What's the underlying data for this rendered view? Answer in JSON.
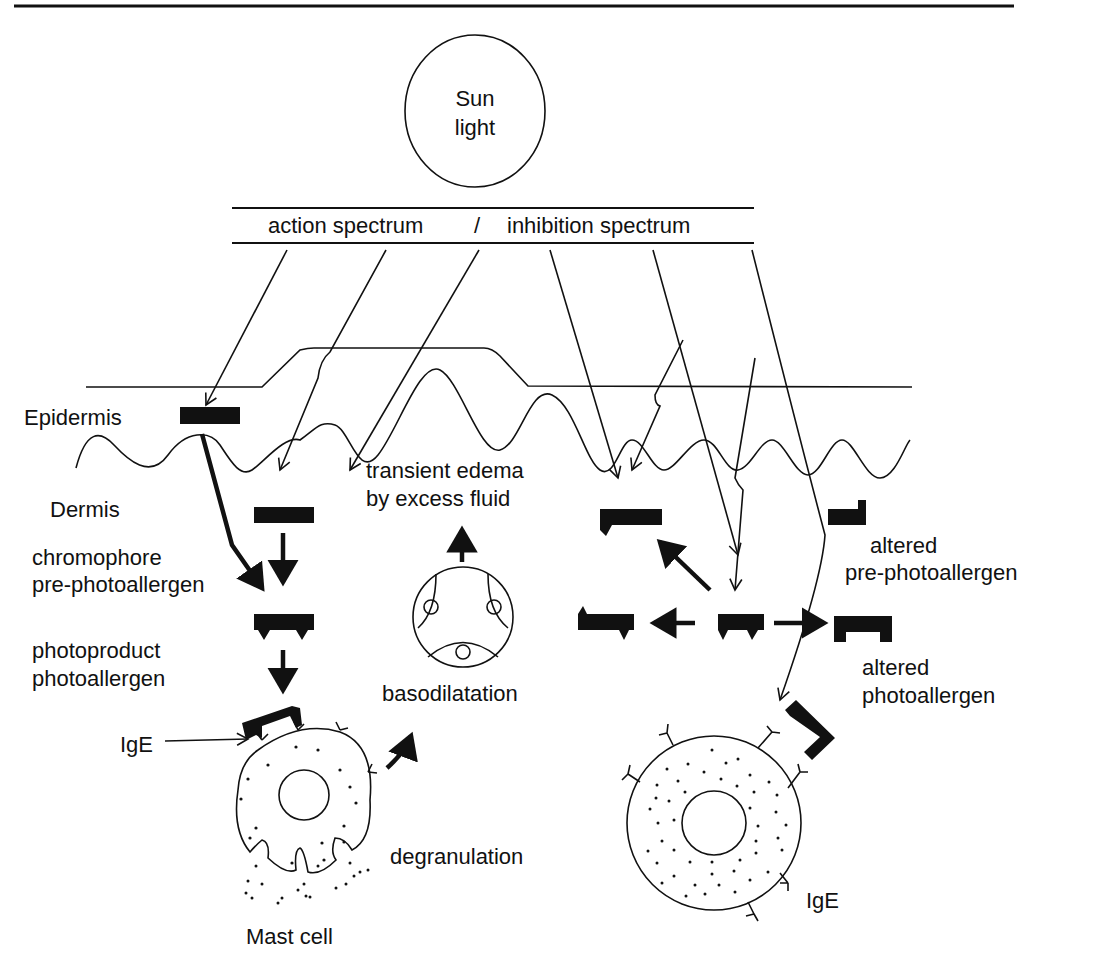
{
  "figure": {
    "sun": {
      "line1": "Sun",
      "line2": "light"
    },
    "spectrum_label": {
      "action": "action spectrum",
      "separator": "/",
      "inhibition": "inhibition spectrum"
    },
    "layers": {
      "epidermis": "Epidermis",
      "dermis": "Dermis"
    },
    "left_labels": {
      "chromophore_line1": "chromophore",
      "chromophore_line2": "pre-photoallergen",
      "photoproduct_line1": "photoproduct",
      "photoproduct_line2": "photoallergen",
      "ige": "IgE"
    },
    "center_labels": {
      "edema_line1": "transient edema",
      "edema_line2": "by excess fluid",
      "basodilatation": "basodilatation",
      "degranulation": "degranulation",
      "mast_cell": "Mast cell"
    },
    "right_labels": {
      "altered_pre_line1": "altered",
      "altered_pre_line2": "pre-photoallergen",
      "altered_photo_line1": "altered",
      "altered_photo_line2": "photoallergen",
      "ige": "IgE"
    },
    "colors": {
      "ink": "#111111",
      "background": "#ffffff"
    }
  }
}
